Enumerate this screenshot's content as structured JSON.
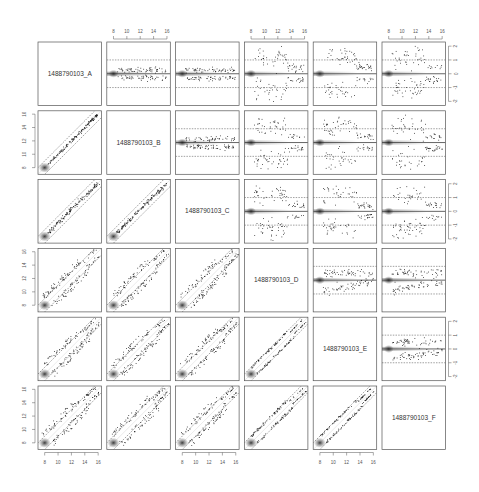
{
  "chart_data": {
    "type": "scatter",
    "subtype": "pairs-matrix",
    "title": "",
    "variables": [
      "1488790103_A",
      "1488790103_B",
      "1488790103_C",
      "1488790103_D",
      "1488790103_E",
      "1488790103_F"
    ],
    "lower_panels": {
      "description": "scatter of column variable (x) vs row variable (y) with density smear near (8,8), identity line band (dashed, ±1)",
      "xlim": [
        7,
        16.5
      ],
      "ylim": [
        7,
        16.5
      ],
      "x_ticks": [
        8,
        10,
        12,
        14,
        16
      ],
      "y_ticks": [
        8,
        10,
        12,
        14,
        16
      ]
    },
    "upper_panels": {
      "description": "MA-style plot: mean (x) vs difference (y) with solid zero line and dashed ±1 lines, density smear near left",
      "xlim": [
        7,
        16.5
      ],
      "ylim": [
        -2.3,
        2.3
      ],
      "x_ticks": [
        8,
        10,
        12,
        14,
        16
      ],
      "y_ticks": [
        -2,
        -1,
        0,
        1,
        2
      ],
      "reference_lines": {
        "solid": 0,
        "dashed": [
          -1,
          1
        ]
      }
    },
    "pair_spread": {
      "A-B": 0.25,
      "A-C": 0.35,
      "A-D": 1.6,
      "A-E": 1.5,
      "A-F": 1.6,
      "B-C": 0.3,
      "B-D": 1.6,
      "B-E": 1.5,
      "B-F": 1.6,
      "C-D": 1.6,
      "C-E": 1.5,
      "C-F": 1.6,
      "D-E": 0.5,
      "D-F": 0.6,
      "E-F": 0.5
    },
    "axes": {
      "top_ticks_on_columns": [
        1,
        3,
        5
      ],
      "bottom_ticks_on_columns": [
        0,
        2,
        4
      ],
      "left_ticks_on_rows": [
        1,
        3,
        5
      ],
      "right_ticks_on_rows": [
        0,
        2,
        4
      ]
    },
    "colors": {
      "points": "#111111",
      "panel_border": "#555555",
      "reference_line": "#222222",
      "dashed_line": "#444444",
      "density": "#333333"
    }
  }
}
